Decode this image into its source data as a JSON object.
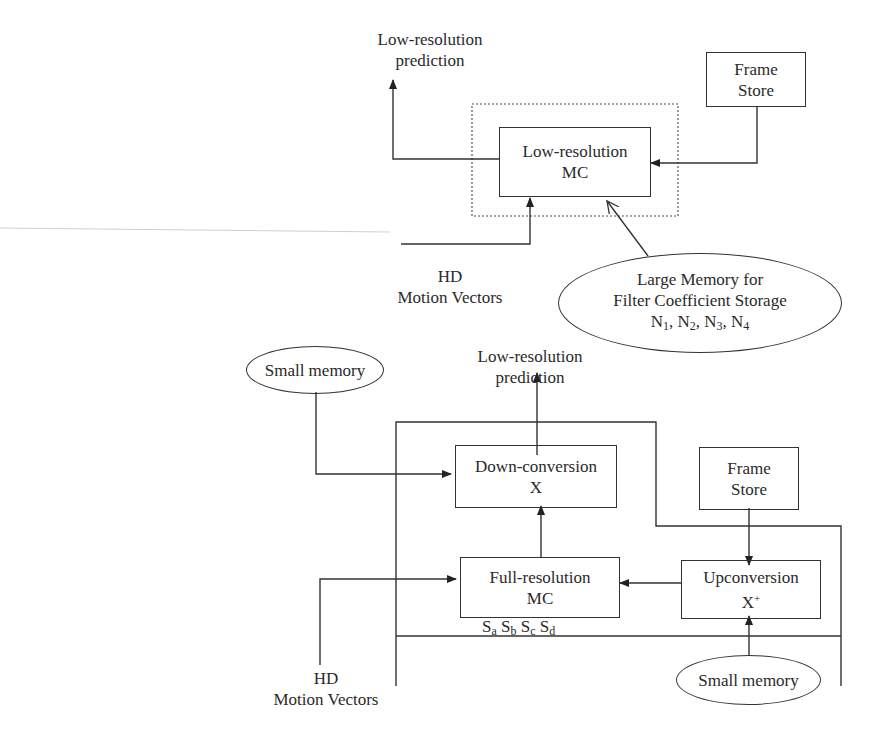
{
  "top_diagram": {
    "output_label_line1": "Low-resolution",
    "output_label_line2": "prediction",
    "frame_store": {
      "line1": "Frame",
      "line2": "Store"
    },
    "mc_block": {
      "line1": "Low-resolution",
      "line2": "MC"
    },
    "motion_vectors": {
      "line1": "HD",
      "line2": "Motion Vectors"
    },
    "large_memory": {
      "line1": "Large Memory for",
      "line2": "Filter Coefficient Storage",
      "coefficients": [
        {
          "base": "N",
          "sub": "1"
        },
        {
          "base": "N",
          "sub": "2"
        },
        {
          "base": "N",
          "sub": "3"
        },
        {
          "base": "N",
          "sub": "4"
        }
      ]
    }
  },
  "bottom_diagram": {
    "output_label_line1": "Low-resolution",
    "output_label_line2": "prediction",
    "small_memory_left": "Small memory",
    "small_memory_right": "Small memory",
    "down_conversion": {
      "line1": "Down-conversion",
      "line2": "X"
    },
    "full_resolution_mc": {
      "line1": "Full-resolution",
      "line2": "MC"
    },
    "frame_store": {
      "line1": "Frame",
      "line2": "Store"
    },
    "upconversion": {
      "line1": "Upconversion",
      "line2_base": "X",
      "line2_sup": "+"
    },
    "sub_blocks": [
      {
        "base": "S",
        "sub": "a"
      },
      {
        "base": "S",
        "sub": "b"
      },
      {
        "base": "S",
        "sub": "c"
      },
      {
        "base": "S",
        "sub": "d"
      }
    ],
    "motion_vectors": {
      "line1": "HD",
      "line2": "Motion Vectors"
    }
  }
}
